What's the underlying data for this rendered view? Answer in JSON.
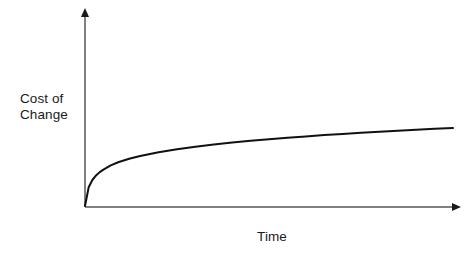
{
  "chart_data": {
    "type": "line",
    "title": "",
    "subtitle": "",
    "xlabel": "Time",
    "ylabel": "Cost of\nChange",
    "ylabel_line1": "Cost of",
    "ylabel_line2": "Change",
    "grid": false,
    "legend": false,
    "legend_position": "none",
    "xlim": [
      0,
      100
    ],
    "ylim": [
      0,
      100
    ],
    "xticks": [],
    "yticks": [],
    "xticklabels": [],
    "yticklabels": [],
    "axis_arrows": {
      "x_axis_arrow": "right",
      "y_axis_arrow": "up"
    },
    "series": [
      {
        "name": "Cost of Change",
        "color": "#111111",
        "linewidth": 2,
        "description": "Logarithmic curve: cost rises steeply at first then flattens, growing slowly over time",
        "x": [
          0,
          1,
          2,
          3,
          4,
          5,
          7,
          9,
          12,
          15,
          20,
          25,
          30,
          35,
          40,
          45,
          50,
          55,
          60,
          65,
          70,
          75,
          80,
          85,
          90,
          95,
          100
        ],
        "y": [
          0,
          9.5,
          13.2,
          15.5,
          17.2,
          18.5,
          20.6,
          22.2,
          24.0,
          25.4,
          27.3,
          28.8,
          30.1,
          31.2,
          32.2,
          33.1,
          33.9,
          34.6,
          35.3,
          36.0,
          36.6,
          37.2,
          37.7,
          38.2,
          38.7,
          39.2,
          39.6
        ]
      }
    ],
    "colors": {
      "axis": "#808080",
      "curve": "#111111",
      "text": "#1a1a1a",
      "background": "#ffffff"
    }
  }
}
